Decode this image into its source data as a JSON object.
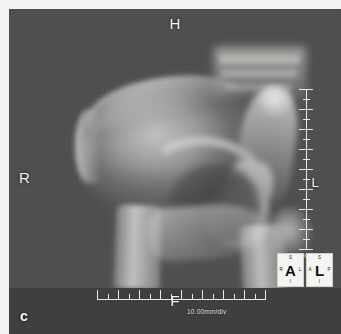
{
  "viewer": {
    "modality": "radiograph",
    "body_part": "hemipelvis-hip"
  },
  "orientation_labels": {
    "top": "H",
    "left": "R",
    "bottom": "F",
    "right": "L",
    "corner": "c"
  },
  "scales": {
    "vertical_label": "10.00mm/div",
    "horizontal_label": "10.00mm/div",
    "vertical_major_ticks": 8,
    "vertical_minor_per_major": 1,
    "horizontal_major_ticks": 8,
    "horizontal_minor_per_major": 1
  },
  "orientation_cubes": [
    {
      "name": "anterior-cube",
      "center": "A",
      "top": "S",
      "bottom": "I",
      "left": "R",
      "right": "L"
    },
    {
      "name": "left-cube",
      "center": "L",
      "top": "S",
      "bottom": "I",
      "left": "A",
      "right": "P"
    }
  ],
  "colors": {
    "canvas_background": "#4e4e4e",
    "footer_band": "#3f3f3f",
    "overlay_text": "#f4f4f4",
    "cube_background": "#f4f4f2",
    "frame_margin": "#f2f2f0"
  }
}
